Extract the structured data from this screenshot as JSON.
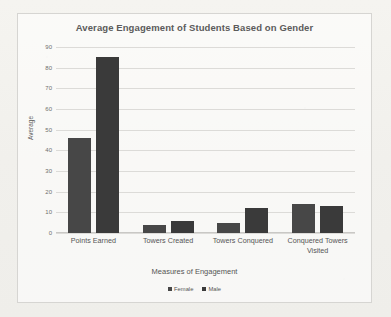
{
  "chart_data": {
    "type": "bar",
    "title": "Average Engagement of Students Based on Gender",
    "xlabel": "Measures of Engagement",
    "ylabel": "Average",
    "categories": [
      "Points Earned",
      "Towers Created",
      "Towers Conquered",
      "Conquered Towers Visited"
    ],
    "series": [
      {
        "name": "Female",
        "values": [
          46,
          4,
          5,
          14
        ],
        "color": "#474747"
      },
      {
        "name": "Male",
        "values": [
          85,
          6,
          12,
          13
        ],
        "color": "#3a3a3a"
      }
    ],
    "ylim": [
      0,
      90
    ],
    "yticks": [
      90,
      80,
      70,
      60,
      50,
      40,
      30,
      20,
      10,
      0
    ],
    "grid": "horizontal",
    "legend_position": "bottom"
  },
  "legend": {
    "entries": [
      {
        "label": "Female"
      },
      {
        "label": "Male"
      }
    ]
  }
}
